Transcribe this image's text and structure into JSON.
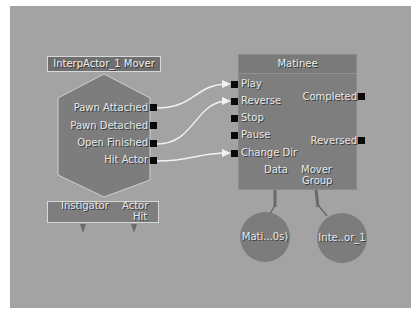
{
  "canvas": {
    "background": "#a3a3a3",
    "node_fill": "#7e7e7e",
    "wire_color": "#f2f2f2",
    "pin_color": "#0a0a0a"
  },
  "event_node": {
    "title": "InterpActor_1 Mover",
    "outputs": [
      "Pawn Attached",
      "Pawn Detached",
      "Open Finished",
      "Hit Actor"
    ],
    "variables": {
      "instigator": "Instigator",
      "actor_hit_line1": "Actor",
      "actor_hit_line2": "Hit"
    }
  },
  "matinee_node": {
    "title": "Matinee",
    "inputs": [
      "Play",
      "Reverse",
      "Stop",
      "Pause",
      "Change Dir"
    ],
    "outputs": [
      "Completed",
      "Reversed"
    ],
    "variables": {
      "data": "Data",
      "mover_line1": "Mover",
      "mover_line2": "Group"
    }
  },
  "variable_nodes": [
    {
      "label": "Mati...0s)"
    },
    {
      "label": "Inte..or_1"
    }
  ],
  "links": [
    {
      "from": "Pawn Attached",
      "to": "Play"
    },
    {
      "from": "Open Finished",
      "to": "Reverse"
    },
    {
      "from": "Hit Actor",
      "to": "Change Dir"
    }
  ]
}
